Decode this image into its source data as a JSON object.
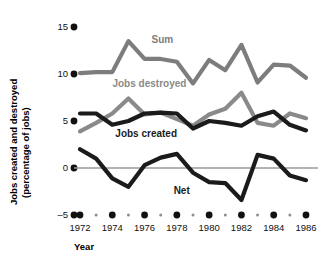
{
  "chart_data": {
    "type": "line",
    "title": "",
    "xlabel": "Year",
    "ylabel": "Jobs created and destroyed (percentage of jobs)",
    "ylabel_line1": "Jobs created and destroyed",
    "ylabel_line2": "(percentage of jobs)",
    "x": [
      1972,
      1973,
      1974,
      1975,
      1976,
      1977,
      1978,
      1979,
      1980,
      1981,
      1982,
      1983,
      1984,
      1985,
      1986
    ],
    "xlim": [
      1972,
      1986
    ],
    "ylim": [
      -5,
      15
    ],
    "yticks": [
      -5,
      0,
      5,
      10,
      15
    ],
    "ytick_labels": [
      "–5",
      "0",
      "5",
      "10",
      "15"
    ],
    "xticks_major": [
      1972,
      1974,
      1976,
      1978,
      1980,
      1982,
      1984,
      1986
    ],
    "xticks_minor": [
      1973,
      1975,
      1977,
      1979,
      1981,
      1983,
      1985
    ],
    "xtick_labels": [
      "1972",
      "1974",
      "1976",
      "1978",
      "1980",
      "1982",
      "1984",
      "1986"
    ],
    "grid": false,
    "legend": "inline-annotations",
    "zero_line": 0,
    "series": [
      {
        "name": "Sum",
        "color": "#7d7d7d",
        "label_x": 1977.1,
        "label_y": 13.3,
        "values": [
          10.1,
          10.2,
          10.2,
          13.5,
          11.6,
          11.6,
          11.3,
          9.0,
          11.5,
          10.4,
          13.1,
          9.1,
          11.0,
          10.9,
          9.6
        ]
      },
      {
        "name": "Jobs destroyed",
        "color": "#8a8a8a",
        "label_x": 1976.3,
        "label_y": 8.6,
        "values": [
          3.9,
          4.8,
          5.8,
          7.4,
          5.7,
          5.9,
          5.2,
          4.5,
          5.7,
          6.3,
          8.0,
          4.8,
          4.5,
          5.8,
          5.3
        ]
      },
      {
        "name": "Jobs created",
        "color": "#1b1b1b",
        "label_x": 1976.1,
        "label_y": 3.3,
        "values": [
          5.8,
          5.8,
          4.6,
          5.0,
          5.8,
          5.9,
          5.8,
          4.2,
          5.0,
          4.8,
          4.5,
          5.5,
          6.0,
          4.6,
          4.0
        ]
      },
      {
        "name": "Net",
        "color": "#1b1b1b",
        "label_x": 1978.3,
        "label_y": -2.8,
        "values": [
          2.0,
          1.0,
          -1.1,
          -2.0,
          0.3,
          1.1,
          1.5,
          -0.5,
          -1.5,
          -1.6,
          -3.4,
          1.4,
          1.0,
          -0.8,
          -1.3
        ]
      }
    ]
  }
}
